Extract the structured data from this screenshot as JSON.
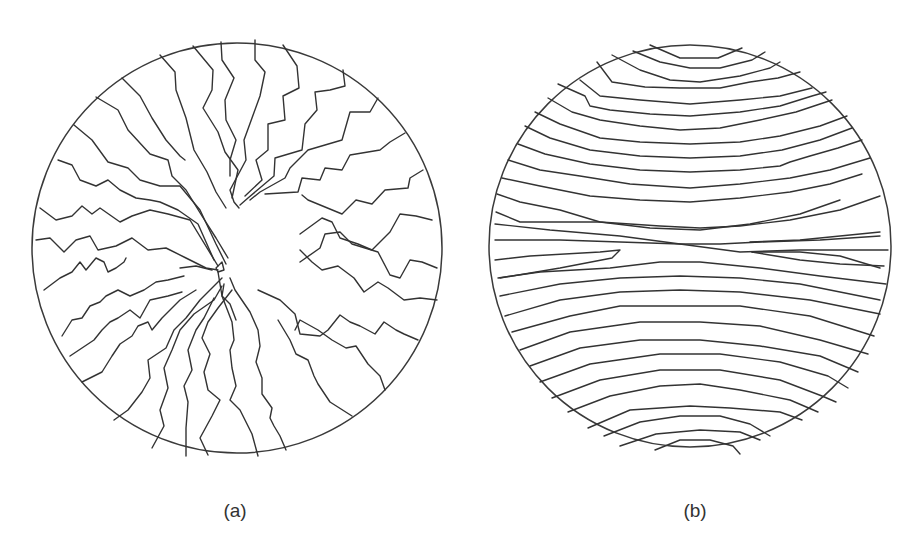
{
  "figure": {
    "panels": [
      {
        "id": "a",
        "label": "(a)",
        "description": "Radial zig-zag line pattern converging toward a central defect",
        "circle": {
          "cx": 237,
          "cy": 248,
          "r": 205
        },
        "line_color": "#333333"
      },
      {
        "id": "b",
        "label": "(b)",
        "description": "Roughly horizontal stratified line pattern with lines curving toward top and bottom, with a central pinch region",
        "circle": {
          "cx": 690,
          "cy": 246,
          "r": 201
        },
        "line_color": "#333333"
      }
    ]
  }
}
